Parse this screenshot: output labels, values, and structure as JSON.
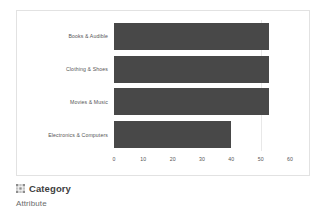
{
  "chart_data": {
    "type": "bar",
    "orientation": "horizontal",
    "title": "",
    "xlabel": "",
    "ylabel": "",
    "categories": [
      "Books & Audible",
      "Clothing & Shoes",
      "Movies & Music",
      "Electronics & Computers"
    ],
    "values": [
      53,
      53,
      53,
      40
    ],
    "xlim": [
      0,
      60
    ],
    "xticks": [
      "0",
      "10",
      "20",
      "30",
      "40",
      "50",
      "60"
    ],
    "xtick_values": [
      0,
      10,
      20,
      30,
      40,
      50,
      60
    ],
    "grid": "vertical-light",
    "legend": "none",
    "bar_color": "#484848"
  },
  "footer": {
    "icon": "grid-icon",
    "title": "Category",
    "subtitle": "Attribute"
  },
  "colors": {
    "bar": "#484848",
    "card_border": "#e2e2e2",
    "gridline": "#e8e8e8",
    "axis_text": "#555555",
    "title_text": "#404040",
    "subtitle_text": "#6b6b6b"
  }
}
